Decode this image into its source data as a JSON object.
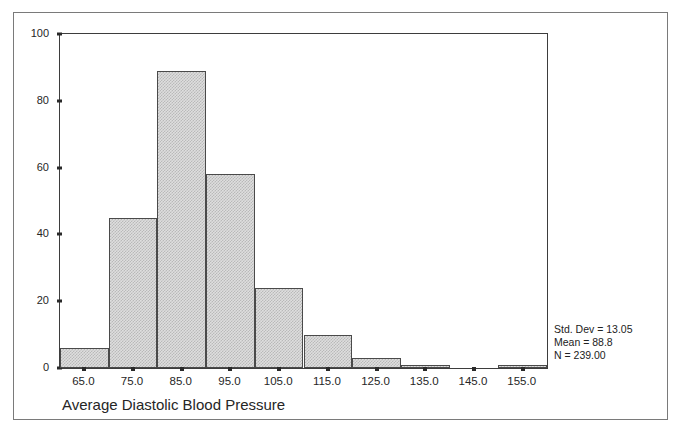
{
  "chart_data": {
    "type": "bar",
    "title": "",
    "xlabel": "Average Diastolic Blood Pressure",
    "ylabel": "",
    "xlim": [
      60,
      160
    ],
    "ylim": [
      0,
      100
    ],
    "grid": false,
    "legend": null,
    "bin_width": 10,
    "categories": [
      "65.0",
      "75.0",
      "85.0",
      "95.0",
      "105.0",
      "115.0",
      "125.0",
      "135.0",
      "145.0",
      "155.0"
    ],
    "bin_centers": [
      65,
      75,
      85,
      95,
      105,
      115,
      125,
      135,
      145,
      155
    ],
    "values": [
      6,
      45,
      89,
      58,
      24,
      10,
      3,
      1,
      0,
      1
    ],
    "y_ticks": [
      0,
      20,
      40,
      60,
      80,
      100
    ],
    "x_tick_labels": [
      "65.0",
      "75.0",
      "85.0",
      "95.0",
      "105.0",
      "115.0",
      "125.0",
      "135.0",
      "145.0",
      "155.0"
    ],
    "annotations": [
      "Std. Dev = 13.05",
      "Mean = 88.8",
      "N = 239.00"
    ],
    "bar_fill_color": "#dedede",
    "bar_edge_color": "#4a4a4a"
  },
  "stats": {
    "std_dev_label": "Std. Dev = 13.05",
    "mean_label": "Mean = 88.8",
    "n_label": "N = 239.00"
  },
  "axis": {
    "x_title": "Average Diastolic Blood Pressure"
  }
}
